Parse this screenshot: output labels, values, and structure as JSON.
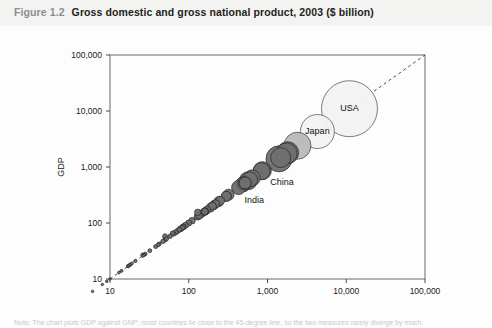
{
  "title": {
    "number": "Figure 1.2",
    "text": "Gross domestic and gross national product, 2003 ($ billion)"
  },
  "footnote": {
    "text": "Note: The chart plots GDP against GNP; most countries lie close to the 45-degree line, so the two measures rarely diverge by much."
  },
  "chart_data": {
    "type": "scatter",
    "title": "Gross domestic and gross national product, 2003 ($ billion)",
    "xlabel": "GNP",
    "ylabel": "GDP",
    "xscale": "log",
    "yscale": "log",
    "xlim": [
      10,
      100000
    ],
    "ylim": [
      10,
      100000
    ],
    "xticks": [
      "10",
      "100",
      "1,000",
      "10,000",
      "100,000"
    ],
    "yticks": [
      "10",
      "100",
      "1,000",
      "10,000",
      "100,000"
    ],
    "grid": false,
    "legend": "none",
    "reference_line": {
      "label": "45-degree line (GDP = GNP)",
      "style": "dashed",
      "from": [
        10,
        10
      ],
      "to": [
        100000,
        100000
      ]
    },
    "annotations": [
      {
        "label": "USA",
        "x": 11000,
        "y": 11000
      },
      {
        "label": "Japan",
        "x": 4300,
        "y": 4300
      },
      {
        "label": "China",
        "x": 1400,
        "y": 1400
      },
      {
        "label": "India",
        "x": 570,
        "y": 570
      }
    ],
    "points": [
      {
        "name": "USA",
        "gnp": 11000,
        "gdp": 11000,
        "size": 28,
        "shade": "light"
      },
      {
        "name": "Japan",
        "gnp": 4300,
        "gdp": 4300,
        "size": 17,
        "shade": "light"
      },
      {
        "name": "Germany",
        "gnp": 2400,
        "gdp": 2400,
        "size": 13.5,
        "shade": "medium"
      },
      {
        "name": "China",
        "gnp": 1400,
        "gdp": 1400,
        "size": 13,
        "shade": "dark"
      },
      {
        "name": "United Kingdom",
        "gnp": 1800,
        "gdp": 1800,
        "size": 11,
        "shade": "dark"
      },
      {
        "name": "France",
        "gnp": 1750,
        "gdp": 1750,
        "size": 10.5,
        "shade": "dark"
      },
      {
        "name": "Italy",
        "gnp": 1470,
        "gdp": 1470,
        "size": 10,
        "shade": "dark"
      },
      {
        "name": "Canada",
        "gnp": 860,
        "gdp": 860,
        "size": 9,
        "shade": "dark"
      },
      {
        "name": "Spain",
        "gnp": 840,
        "gdp": 840,
        "size": 8.5,
        "shade": "dark"
      },
      {
        "name": "India",
        "gnp": 570,
        "gdp": 570,
        "size": 9,
        "shade": "dark"
      },
      {
        "name": "Mexico",
        "gnp": 640,
        "gdp": 640,
        "size": 8,
        "shade": "dark"
      },
      {
        "name": "Korea",
        "gnp": 600,
        "gdp": 600,
        "size": 7.5,
        "shade": "dark"
      },
      {
        "name": "Brazil",
        "gnp": 490,
        "gdp": 490,
        "size": 7.5,
        "shade": "dark"
      },
      {
        "name": "Russia",
        "gnp": 430,
        "gdp": 430,
        "size": 7,
        "shade": "dark"
      },
      {
        "name": "Netherlands",
        "gnp": 510,
        "gdp": 510,
        "size": 6.5,
        "shade": "dark"
      },
      {
        "name": "Australia",
        "gnp": 520,
        "gdp": 520,
        "size": 6,
        "shade": "dark"
      },
      {
        "name": "Switzerland",
        "gnp": 320,
        "gdp": 320,
        "size": 5.5,
        "shade": "dark"
      },
      {
        "name": "Belgium",
        "gnp": 300,
        "gdp": 300,
        "size": 5,
        "shade": "dark"
      },
      {
        "name": "Sweden",
        "gnp": 300,
        "gdp": 300,
        "size": 5,
        "shade": "dark"
      },
      {
        "name": "Turkey",
        "gnp": 240,
        "gdp": 240,
        "size": 5,
        "shade": "dark"
      },
      {
        "name": "Austria",
        "gnp": 250,
        "gdp": 250,
        "size": 4.5,
        "shade": "dark"
      },
      {
        "name": "Indonesia",
        "gnp": 210,
        "gdp": 210,
        "size": 4.5,
        "shade": "dark"
      },
      {
        "name": "Saudi Arabia",
        "gnp": 190,
        "gdp": 190,
        "size": 4.5,
        "shade": "dark"
      },
      {
        "name": "Denmark",
        "gnp": 210,
        "gdp": 210,
        "size": 4,
        "shade": "dark"
      },
      {
        "name": "Norway",
        "gnp": 220,
        "gdp": 220,
        "size": 4,
        "shade": "dark"
      },
      {
        "name": "Poland",
        "gnp": 200,
        "gdp": 200,
        "size": 4,
        "shade": "dark"
      },
      {
        "name": "Greece",
        "gnp": 170,
        "gdp": 170,
        "size": 3.8,
        "shade": "dark"
      },
      {
        "name": "Finland",
        "gnp": 160,
        "gdp": 160,
        "size": 3.8,
        "shade": "dark"
      },
      {
        "name": "Hong Kong",
        "gnp": 160,
        "gdp": 160,
        "size": 3.6,
        "shade": "dark"
      },
      {
        "name": "Portugal",
        "gnp": 150,
        "gdp": 150,
        "size": 3.5,
        "shade": "dark"
      },
      {
        "name": "Thailand",
        "gnp": 140,
        "gdp": 140,
        "size": 3.5,
        "shade": "dark"
      },
      {
        "name": "Argentina",
        "gnp": 130,
        "gdp": 130,
        "size": 3.5,
        "shade": "dark"
      },
      {
        "name": "Iran",
        "gnp": 135,
        "gdp": 135,
        "size": 3.4,
        "shade": "dark"
      },
      {
        "name": "South Africa",
        "gnp": 160,
        "gdp": 160,
        "size": 3.4,
        "shade": "dark"
      },
      {
        "name": "Israel",
        "gnp": 110,
        "gdp": 110,
        "size": 3.2,
        "shade": "dark"
      },
      {
        "name": "Ireland",
        "gnp": 130,
        "gdp": 155,
        "size": 3.2,
        "shade": "dark"
      },
      {
        "name": "Malaysia",
        "gnp": 100,
        "gdp": 100,
        "size": 3,
        "shade": "dark"
      },
      {
        "name": "Singapore",
        "gnp": 91,
        "gdp": 91,
        "size": 3,
        "shade": "dark"
      },
      {
        "name": "Venezuela",
        "gnp": 85,
        "gdp": 85,
        "size": 3,
        "shade": "dark"
      },
      {
        "name": "Colombia",
        "gnp": 78,
        "gdp": 78,
        "size": 2.8,
        "shade": "dark"
      },
      {
        "name": "Philippines",
        "gnp": 80,
        "gdp": 80,
        "size": 2.8,
        "shade": "dark"
      },
      {
        "name": "Chile",
        "gnp": 72,
        "gdp": 72,
        "size": 2.6,
        "shade": "dark"
      },
      {
        "name": "Czech Republic",
        "gnp": 85,
        "gdp": 85,
        "size": 2.6,
        "shade": "dark"
      },
      {
        "name": "Pakistan",
        "gnp": 68,
        "gdp": 68,
        "size": 2.6,
        "shade": "dark"
      },
      {
        "name": "Egypt",
        "gnp": 82,
        "gdp": 82,
        "size": 2.5,
        "shade": "dark"
      },
      {
        "name": "New Zealand",
        "gnp": 76,
        "gdp": 76,
        "size": 2.4,
        "shade": "dark"
      },
      {
        "name": "Hungary",
        "gnp": 64,
        "gdp": 64,
        "size": 2.4,
        "shade": "dark"
      },
      {
        "name": "Nigeria",
        "gnp": 50,
        "gdp": 58,
        "size": 2.4,
        "shade": "dark"
      },
      {
        "name": "Romania",
        "gnp": 50,
        "gdp": 50,
        "size": 2.2,
        "shade": "dark"
      },
      {
        "name": "Ukraine",
        "gnp": 47,
        "gdp": 47,
        "size": 2.2,
        "shade": "dark"
      },
      {
        "name": "Peru",
        "gnp": 58,
        "gdp": 58,
        "size": 2.2,
        "shade": "dark"
      },
      {
        "name": "Algeria",
        "gnp": 62,
        "gdp": 66,
        "size": 2.1,
        "shade": "dark"
      },
      {
        "name": "Bangladesh",
        "gnp": 52,
        "gdp": 52,
        "size": 2.1,
        "shade": "dark"
      },
      {
        "name": "Vietnam",
        "gnp": 38,
        "gdp": 38,
        "size": 2,
        "shade": "dark"
      },
      {
        "name": "Morocco",
        "gnp": 42,
        "gdp": 42,
        "size": 2,
        "shade": "dark"
      },
      {
        "name": "Slovakia",
        "gnp": 32,
        "gdp": 32,
        "size": 1.9,
        "shade": "dark"
      },
      {
        "name": "Kuwait",
        "gnp": 41,
        "gdp": 41,
        "size": 1.9,
        "shade": "dark"
      },
      {
        "name": "Croatia",
        "gnp": 28,
        "gdp": 28,
        "size": 1.8,
        "shade": "dark"
      },
      {
        "name": "Luxembourg",
        "gnp": 26,
        "gdp": 27,
        "size": 1.8,
        "shade": "dark"
      },
      {
        "name": "Belarus",
        "gnp": 17,
        "gdp": 17,
        "size": 1.7,
        "shade": "dark"
      },
      {
        "name": "Ecuador",
        "gnp": 27,
        "gdp": 27,
        "size": 1.7,
        "shade": "dark"
      },
      {
        "name": "Slovenia",
        "gnp": 26,
        "gdp": 26,
        "size": 1.6,
        "shade": "dark"
      },
      {
        "name": "Sri Lanka",
        "gnp": 18,
        "gdp": 18,
        "size": 1.6,
        "shade": "dark"
      },
      {
        "name": "Oman",
        "gnp": 21,
        "gdp": 21,
        "size": 1.6,
        "shade": "dark"
      },
      {
        "name": "Lithuania",
        "gnp": 18,
        "gdp": 18,
        "size": 1.5,
        "shade": "dark"
      },
      {
        "name": "Kenya",
        "gnp": 14,
        "gdp": 14,
        "size": 1.5,
        "shade": "dark"
      },
      {
        "name": "Bulgaria",
        "gnp": 19,
        "gdp": 19,
        "size": 1.5,
        "shade": "dark"
      },
      {
        "name": "Costa Rica",
        "gnp": 17,
        "gdp": 17,
        "size": 1.4,
        "shade": "dark"
      },
      {
        "name": "Panama",
        "gnp": 13,
        "gdp": 13,
        "size": 1.4,
        "shade": "dark"
      },
      {
        "name": "Estonia",
        "gnp": 9.1,
        "gdp": 9.1,
        "size": 1.3,
        "shade": "dark"
      },
      {
        "name": "Jordan",
        "gnp": 10,
        "gdp": 10,
        "size": 1.3,
        "shade": "dark"
      },
      {
        "name": "Bolivia",
        "gnp": 8,
        "gdp": 8,
        "size": 1.2,
        "shade": "dark"
      },
      {
        "name": "Nepal",
        "gnp": 6,
        "gdp": 6,
        "size": 1.2,
        "shade": "dark"
      }
    ]
  }
}
